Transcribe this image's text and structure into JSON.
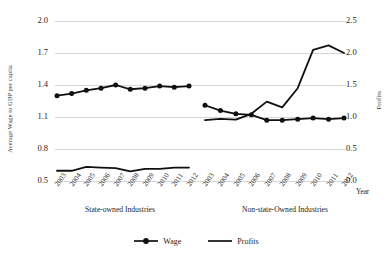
{
  "chart_data": {
    "type": "line",
    "title": "",
    "xlabel": "Year",
    "ylabel": "Average Wage to GDP per capita",
    "ylabel_right": "Profits",
    "ylim": [
      0.5,
      2.0
    ],
    "ylim_right": [
      0.0,
      2.5
    ],
    "yticks": [
      "2.0",
      "1.7",
      "1.4",
      "1.1",
      "0.8",
      "0.5"
    ],
    "yticks_right": [
      "2.5",
      "2.0",
      "1.5",
      "1.0",
      "0.5",
      "0.0"
    ],
    "grid": true,
    "legend_position": "bottom-center",
    "legend": [
      "Wage",
      "Profits"
    ],
    "groups": [
      {
        "name": "State-owned Industries",
        "categories": [
          "2003",
          "2004",
          "2005",
          "2006",
          "2007",
          "2008",
          "2009",
          "2010",
          "2011",
          "2012"
        ],
        "series": [
          {
            "name": "Wage",
            "axis": "left",
            "values": [
              1.3,
              1.32,
              1.35,
              1.37,
              1.4,
              1.36,
              1.37,
              1.39,
              1.38,
              1.39,
              1.39
            ]
          },
          {
            "name": "Profits",
            "axis": "right",
            "values": [
              0.16,
              0.16,
              0.22,
              0.21,
              0.2,
              0.15,
              0.19,
              0.19,
              0.21,
              0.21
            ]
          }
        ]
      },
      {
        "name": "Non-state-Owned Industries",
        "categories": [
          "2003",
          "2004",
          "2005",
          "2006",
          "2007",
          "2008",
          "2009",
          "2010",
          "2011",
          "2012"
        ],
        "series": [
          {
            "name": "Wage",
            "axis": "left",
            "values": [
              1.21,
              1.16,
              1.13,
              1.12,
              1.07,
              1.07,
              1.08,
              1.09,
              1.08,
              1.09,
              1.1
            ]
          },
          {
            "name": "Profits",
            "axis": "right",
            "values": [
              0.95,
              0.97,
              0.96,
              1.05,
              1.24,
              1.15,
              1.45,
              2.05,
              2.12,
              2.0
            ]
          }
        ]
      }
    ],
    "colors": {
      "wage": "#101010",
      "profits": "#101010",
      "grid": "#d6d6d6",
      "background": "#ffffff"
    }
  }
}
